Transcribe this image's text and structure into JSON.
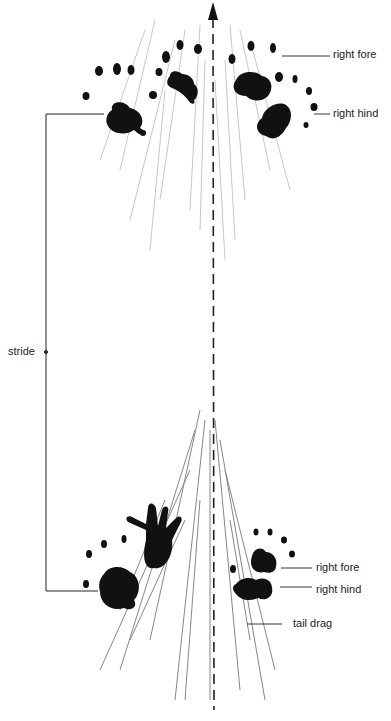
{
  "diagram": {
    "labels": {
      "top_right_fore": "right  fore",
      "top_right_hind": "right hind",
      "stride": "stride",
      "bottom_right_fore": "right  fore",
      "bottom_right_hind": "right  hind",
      "tail_drag": "tail drag"
    },
    "colors": {
      "ink": "#111111",
      "background": "#ffffff",
      "streaks": "#9a9a9a"
    }
  }
}
